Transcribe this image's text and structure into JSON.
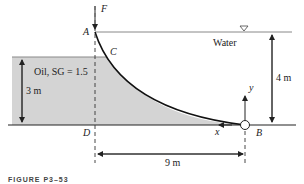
{
  "figure": {
    "caption": "FIGURE P3–53",
    "colors": {
      "oil_fill": "#d4d4d4",
      "line": "#222222",
      "surface_line": "#888888"
    }
  },
  "labels": {
    "force": "F",
    "point_a": "A",
    "point_b": "B",
    "point_c": "C",
    "point_d": "D",
    "water": "Water",
    "oil": "Oil, SG = 1.5",
    "axis_x": "x",
    "axis_y": "y",
    "free_surface_symbol": "▽"
  },
  "dimensions": {
    "water_depth": "4 m",
    "oil_depth": "3 m",
    "horizontal_span": "9 m"
  }
}
